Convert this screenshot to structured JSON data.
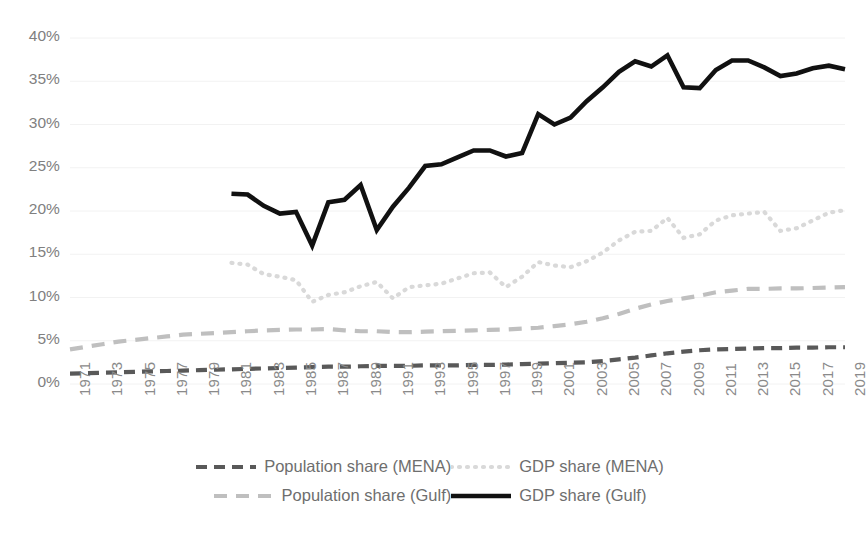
{
  "chart_data": {
    "type": "line",
    "title": "",
    "subtitle": "",
    "xlabel": "",
    "ylabel": "",
    "xlim": [
      1971,
      2019
    ],
    "ylim": [
      0,
      0.4
    ],
    "ytick_labels": [
      "0%",
      "5%",
      "10%",
      "15%",
      "20%",
      "25%",
      "30%",
      "35%",
      "40%"
    ],
    "ytick_values": [
      0,
      5,
      10,
      15,
      20,
      25,
      30,
      35,
      40
    ],
    "ytick_step_percent": 5,
    "grid": true,
    "grid_axis": "y",
    "legend_position": "bottom",
    "x": [
      1971,
      1972,
      1973,
      1974,
      1975,
      1976,
      1977,
      1978,
      1979,
      1980,
      1981,
      1982,
      1983,
      1984,
      1985,
      1986,
      1987,
      1988,
      1989,
      1990,
      1991,
      1992,
      1993,
      1994,
      1995,
      1996,
      1997,
      1998,
      1999,
      2000,
      2001,
      2002,
      2003,
      2004,
      2005,
      2006,
      2007,
      2008,
      2009,
      2010,
      2011,
      2012,
      2013,
      2014,
      2015,
      2016,
      2017,
      2018,
      2019
    ],
    "xtick_labels": [
      "1971",
      "1973",
      "1975",
      "1977",
      "1979",
      "1981",
      "1983",
      "1985",
      "1987",
      "1989",
      "1991",
      "1993",
      "1995",
      "1997",
      "1999",
      "2001",
      "2003",
      "2005",
      "2007",
      "2009",
      "2011",
      "2013",
      "2015",
      "2017",
      "2019"
    ],
    "xtick_step_years": 2,
    "series": [
      {
        "name": "Population share (MENA)",
        "key": "pop_mena",
        "color": "#595959",
        "style": "dashed",
        "width": 4.2,
        "dash": "11,7",
        "start_year": 1971,
        "values": [
          1.2,
          1.25,
          1.3,
          1.35,
          1.4,
          1.45,
          1.5,
          1.55,
          1.6,
          1.65,
          1.7,
          1.75,
          1.8,
          1.85,
          1.9,
          1.95,
          2.0,
          2.0,
          2.05,
          2.1,
          2.1,
          2.1,
          2.15,
          2.15,
          2.15,
          2.2,
          2.2,
          2.25,
          2.3,
          2.35,
          2.4,
          2.45,
          2.5,
          2.65,
          2.85,
          3.05,
          3.3,
          3.55,
          3.75,
          3.9,
          4.0,
          4.05,
          4.1,
          4.15,
          4.15,
          4.2,
          4.2,
          4.25,
          4.25
        ]
      },
      {
        "name": "GDP share (MENA)",
        "key": "gdp_mena",
        "color": "#d9d9d9",
        "style": "dotted",
        "width": 4.2,
        "dash": "1,7",
        "start_year": 1981,
        "values": [
          null,
          null,
          null,
          null,
          null,
          null,
          null,
          null,
          null,
          null,
          14.0,
          13.8,
          12.7,
          12.4,
          12.0,
          9.5,
          10.3,
          10.6,
          11.3,
          11.8,
          9.9,
          11.2,
          11.4,
          11.6,
          12.2,
          12.8,
          12.9,
          11.2,
          12.4,
          14.1,
          13.7,
          13.5,
          14.2,
          15.2,
          16.6,
          17.6,
          17.7,
          19.2,
          16.9,
          17.3,
          18.9,
          19.5,
          19.7,
          19.9,
          17.7,
          18.0,
          18.9,
          19.8,
          20.1
        ]
      },
      {
        "name": "Population share (Gulf)",
        "key": "pop_gulf",
        "color": "#bfbfbf",
        "style": "dashed",
        "width": 4.2,
        "dash": "13,9",
        "start_year": 1971,
        "values": [
          4.0,
          4.3,
          4.6,
          4.9,
          5.1,
          5.3,
          5.5,
          5.7,
          5.8,
          5.9,
          6.0,
          6.1,
          6.2,
          6.25,
          6.3,
          6.3,
          6.35,
          6.2,
          6.1,
          6.1,
          6.0,
          6.0,
          6.05,
          6.1,
          6.15,
          6.2,
          6.25,
          6.3,
          6.4,
          6.5,
          6.7,
          6.9,
          7.2,
          7.6,
          8.1,
          8.7,
          9.2,
          9.6,
          9.9,
          10.2,
          10.6,
          10.8,
          11.0,
          11.0,
          11.05,
          11.05,
          11.1,
          11.15,
          11.2
        ]
      },
      {
        "name": "GDP share (Gulf)",
        "key": "gdp_gulf",
        "color": "#111111",
        "style": "solid",
        "width": 4.6,
        "dash": "",
        "start_year": 1981,
        "values": [
          null,
          null,
          null,
          null,
          null,
          null,
          null,
          null,
          null,
          null,
          22.0,
          21.9,
          20.6,
          19.7,
          19.9,
          16.0,
          21.0,
          21.3,
          23.0,
          17.8,
          20.5,
          22.7,
          25.2,
          25.4,
          26.2,
          27.0,
          27.0,
          26.3,
          26.7,
          31.2,
          30.0,
          30.8,
          32.7,
          34.3,
          36.1,
          37.3,
          36.7,
          38.0,
          34.3,
          34.2,
          36.3,
          37.4,
          37.4,
          36.6,
          35.6,
          35.9,
          36.5,
          36.8,
          36.4
        ]
      }
    ]
  },
  "axes": {
    "plot_left": 70,
    "plot_right": 845,
    "plot_top": 38,
    "plot_bottom": 384
  },
  "legend": {
    "row1": [
      {
        "label": "Population share (MENA)",
        "series_key": "pop_mena"
      },
      {
        "label": "GDP share (MENA)",
        "series_key": "gdp_mena"
      }
    ],
    "row2": [
      {
        "label": "Population share (Gulf)",
        "series_key": "pop_gulf"
      },
      {
        "label": "GDP share (Gulf)",
        "series_key": "gdp_gulf"
      }
    ]
  },
  "colors": {
    "background": "#ffffff",
    "gridline": "#f2f2f2",
    "tick_text": "#808080",
    "legend_text": "#6e6e6e"
  }
}
